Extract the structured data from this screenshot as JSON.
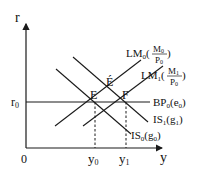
{
  "diagram": {
    "axes": {
      "y_label": "r",
      "x_label": "y",
      "origin_label": "0",
      "r0_label": "r",
      "r0_sub": "0",
      "y0_label": "y",
      "y0_sub": "0",
      "y1_label": "y",
      "y1_sub": "1"
    },
    "points": {
      "E": "E",
      "E_prime": "É",
      "F": "F"
    },
    "curves": {
      "LM0": {
        "name": "LM",
        "sub": "0",
        "num": "M",
        "num_sub": "0",
        "den": "P",
        "den_sub": "0"
      },
      "LM1": {
        "name": "LM",
        "sub": "1",
        "num": "M",
        "num_sub": "1",
        "den": "P",
        "den_sub": "0"
      },
      "BP0": {
        "name": "BP",
        "sub": "0",
        "arg": "e",
        "arg_sub": "0"
      },
      "IS1": {
        "name": "IS",
        "sub": "1",
        "arg": "g",
        "arg_sub": "1"
      },
      "IS0": {
        "name": "IS",
        "sub": "0",
        "arg": "g",
        "arg_sub": "0"
      }
    },
    "colors": {
      "line": "#1a1a1a",
      "background": "#ffffff"
    }
  }
}
